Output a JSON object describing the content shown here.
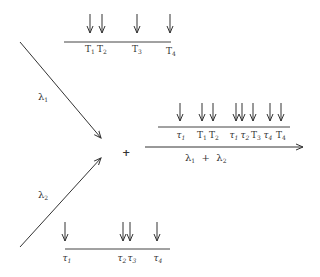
{
  "diagram": {
    "type": "superposition of Poisson processes",
    "colors": {
      "ink": "#333333",
      "background": "#ffffff"
    },
    "process_1": {
      "rate_label": "λ",
      "rate_sub": "1",
      "event_symbol": "T",
      "events": [
        {
          "label": "T",
          "sub": "1",
          "x": 90
        },
        {
          "label": "T",
          "sub": "2",
          "x": 102
        },
        {
          "label": "T",
          "sub": "3",
          "x": 137
        },
        {
          "label": "T",
          "sub": "4",
          "x": 170
        }
      ]
    },
    "process_2": {
      "rate_label": "λ",
      "rate_sub": "2",
      "event_symbol": "τ",
      "events": [
        {
          "label": "τ",
          "sub": "1",
          "x": 65
        },
        {
          "label": "τ",
          "sub": "2",
          "x": 123
        },
        {
          "label": "τ",
          "sub": "3",
          "x": 130
        },
        {
          "label": "τ",
          "sub": "4",
          "x": 157
        }
      ]
    },
    "operator": "+",
    "merged_process": {
      "rate_label": "λ₁ + λ₂",
      "rate_parts": [
        "λ",
        "1",
        "+",
        "λ",
        "2"
      ],
      "events": [
        {
          "label": "τ",
          "sub": "1",
          "x": 180
        },
        {
          "label": "T",
          "sub": "1",
          "x": 202
        },
        {
          "label": "T",
          "sub": "2",
          "x": 213
        },
        {
          "label": "τ",
          "sub": "1",
          "x": 236
        },
        {
          "label": "τ",
          "sub": "2",
          "x": 242
        },
        {
          "label": "T",
          "sub": "3",
          "x": 253
        },
        {
          "label": "τ",
          "sub": "4",
          "x": 270
        },
        {
          "label": "T",
          "sub": "4",
          "x": 281
        }
      ]
    }
  }
}
